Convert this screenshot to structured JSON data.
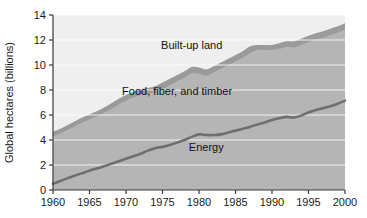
{
  "chart_data": {
    "type": "area",
    "title": "",
    "subtitle": "",
    "xlabel": "",
    "ylabel": "Global hectares (billions)",
    "xlim": [
      1960,
      2000
    ],
    "ylim": [
      0,
      14
    ],
    "xticks": [
      1960,
      1965,
      1970,
      1975,
      1980,
      1985,
      1990,
      1995,
      2000
    ],
    "yticks": [
      0,
      2,
      4,
      6,
      8,
      10,
      12,
      14
    ],
    "grid": true,
    "grid_axis": "y",
    "grid_color": "#ffffff",
    "legend_position": "inline-annotations",
    "stacked": true,
    "x": [
      1960,
      1961,
      1962,
      1963,
      1964,
      1965,
      1966,
      1967,
      1968,
      1969,
      1970,
      1971,
      1972,
      1973,
      1974,
      1975,
      1976,
      1977,
      1978,
      1979,
      1980,
      1981,
      1982,
      1983,
      1984,
      1985,
      1986,
      1987,
      1988,
      1989,
      1990,
      1991,
      1992,
      1993,
      1994,
      1995,
      1996,
      1997,
      1998,
      1999,
      2000
    ],
    "series": [
      {
        "name": "Energy",
        "color": "#6f6f6f",
        "label_x": 1981,
        "label_y": 3.1,
        "values": [
          0.5,
          0.72,
          0.95,
          1.15,
          1.35,
          1.55,
          1.72,
          1.9,
          2.1,
          2.3,
          2.5,
          2.7,
          2.9,
          3.15,
          3.35,
          3.45,
          3.6,
          3.8,
          4.0,
          4.25,
          4.45,
          4.4,
          4.4,
          4.45,
          4.6,
          4.75,
          4.9,
          5.05,
          5.25,
          5.4,
          5.6,
          5.75,
          5.85,
          5.8,
          5.95,
          6.2,
          6.4,
          6.55,
          6.7,
          6.9,
          7.15
        ]
      },
      {
        "name": "Food, fiber, and timber",
        "color": "#b5b5b5",
        "label_x": 1977,
        "label_y": 7.6,
        "cumulative_top": [
          4.3,
          4.55,
          4.8,
          5.1,
          5.4,
          5.65,
          5.9,
          6.2,
          6.5,
          6.85,
          7.15,
          7.4,
          7.6,
          7.7,
          7.85,
          8.1,
          8.4,
          8.7,
          9.0,
          9.35,
          9.3,
          9.15,
          9.4,
          9.7,
          10.0,
          10.3,
          10.6,
          10.95,
          11.2,
          11.2,
          11.2,
          11.3,
          11.45,
          11.4,
          11.6,
          11.85,
          12.05,
          12.2,
          12.4,
          12.6,
          12.85
        ]
      },
      {
        "name": "Built-up land",
        "color": "#9a9a9a",
        "label_x": 1979,
        "label_y": 11.3,
        "cumulative_top": [
          4.65,
          4.9,
          5.2,
          5.5,
          5.8,
          6.05,
          6.3,
          6.6,
          6.95,
          7.3,
          7.6,
          7.85,
          8.05,
          8.15,
          8.3,
          8.6,
          8.9,
          9.2,
          9.5,
          9.85,
          9.8,
          9.65,
          9.9,
          10.2,
          10.5,
          10.8,
          11.1,
          11.5,
          11.6,
          11.6,
          11.6,
          11.75,
          11.9,
          11.9,
          12.1,
          12.35,
          12.55,
          12.7,
          12.9,
          13.1,
          13.35
        ]
      }
    ],
    "annotations": [
      {
        "text": "Built-up land",
        "x": 1979,
        "y": 11.3
      },
      {
        "text": "Food, fiber, and timber",
        "x": 1977,
        "y": 7.6
      },
      {
        "text": "Energy",
        "x": 1981,
        "y": 3.1
      }
    ],
    "colors": {
      "plot_background": "#efefef",
      "band_food": "#b5b5b5",
      "band_builtup": "#9a9a9a",
      "line_energy": "#6f6f6f",
      "axis": "#3a3a3a",
      "gridline": "#ffffff",
      "page_background": "#ffffff"
    }
  }
}
